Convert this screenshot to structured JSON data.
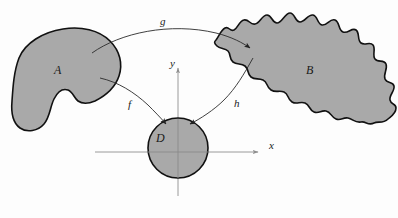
{
  "figure": {
    "type": "mathematical-diagram",
    "width": 398,
    "height": 218,
    "background_color": "#fdfdfd"
  },
  "colors": {
    "region_fill": "#a9a9a9",
    "region_stroke": "#101010",
    "axis_stroke": "#999999",
    "arrow_stroke": "#2a2a2a",
    "label_color": "#1a1a1a"
  },
  "regions": [
    {
      "id": "region-A",
      "label": "A",
      "shape": "kidney-blob",
      "label_position": {
        "x": 58,
        "y": 70
      }
    },
    {
      "id": "region-B",
      "label": "B",
      "shape": "wavy-band",
      "label_position": {
        "x": 310,
        "y": 70
      }
    },
    {
      "id": "region-D",
      "label": "D",
      "shape": "disk",
      "center": {
        "x": 178,
        "y": 148
      },
      "radius": 30,
      "label_position": {
        "x": 160,
        "y": 138
      }
    }
  ],
  "mappings": [
    {
      "id": "map-g",
      "label": "g",
      "from": "A",
      "to": "B",
      "label_position": {
        "x": 163,
        "y": 22
      }
    },
    {
      "id": "map-f",
      "label": "f",
      "from": "A",
      "to": "D",
      "label_position": {
        "x": 131,
        "y": 105
      }
    },
    {
      "id": "map-h",
      "label": "h",
      "from": "B",
      "to": "D",
      "label_position": {
        "x": 237,
        "y": 104
      }
    }
  ],
  "axes": {
    "x_label": "x",
    "y_label": "y",
    "origin": {
      "x": 178,
      "y": 152
    },
    "x_extent": {
      "from": 95,
      "to": 262
    },
    "y_extent": {
      "from": 196,
      "to": 65
    },
    "x_label_position": {
      "x": 272,
      "y": 146
    },
    "y_label_position": {
      "x": 173,
      "y": 64
    }
  }
}
